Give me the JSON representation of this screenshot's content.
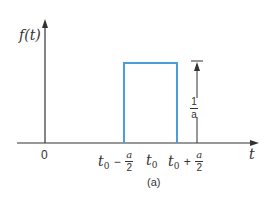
{
  "figure": {
    "y_axis_label": "f(t)",
    "x_axis_label": "t",
    "origin_label": "0",
    "caption": "(a)",
    "ticks": {
      "left": {
        "base": "t",
        "sub": "0",
        "op": "−",
        "num": "a",
        "den": "2"
      },
      "center": {
        "base": "t",
        "sub": "0"
      },
      "right": {
        "base": "t",
        "sub": "0",
        "op": "+",
        "num": "a",
        "den": "2"
      }
    },
    "height_label": {
      "num": "1",
      "den": "a"
    },
    "colors": {
      "pulse": "#4a9fd8",
      "axis": "#333333"
    }
  }
}
